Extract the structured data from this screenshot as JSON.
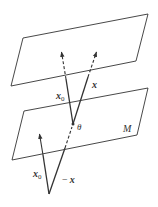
{
  "diagram": {
    "planes": [
      {
        "id": "V",
        "label": "V = x + M",
        "label_parts": {
          "V": "V",
          "eq": " = ",
          "x": "x",
          "plus": " + ",
          "M": "M"
        },
        "corners": [
          [
            23,
            38
          ],
          [
            148,
            14
          ],
          [
            136,
            61
          ],
          [
            11,
            86
          ]
        ]
      },
      {
        "id": "M",
        "label": "M",
        "corners": [
          [
            24,
            111
          ],
          [
            148,
            88
          ],
          [
            137,
            135
          ],
          [
            12,
            160
          ]
        ]
      }
    ],
    "vectors": [
      {
        "id": "x0-upper",
        "label": "x",
        "sub": "0",
        "from": [
          73,
          124
        ],
        "to": [
          61,
          50
        ]
      },
      {
        "id": "x-upper",
        "label": "x",
        "from": [
          73,
          124
        ],
        "to": [
          97,
          50
        ]
      },
      {
        "id": "x0-lower",
        "label": "x",
        "sub": "0",
        "from": [
          49,
          194
        ],
        "to": [
          39,
          133
        ]
      },
      {
        "id": "neg-x",
        "label": "− x",
        "from": [
          49,
          194
        ],
        "to": [
          73,
          124
        ]
      }
    ],
    "angle_label": "θ",
    "labels": {
      "x0_upper": {
        "main": "x",
        "sub": "0"
      },
      "x_upper": "x",
      "theta": "θ",
      "M": "M",
      "x0_lower": {
        "main": "x",
        "sub": "0"
      },
      "neg_x": {
        "minus": "−",
        "main": "x"
      }
    },
    "colors": {
      "stroke": "#333333",
      "background": "#ffffff"
    }
  }
}
